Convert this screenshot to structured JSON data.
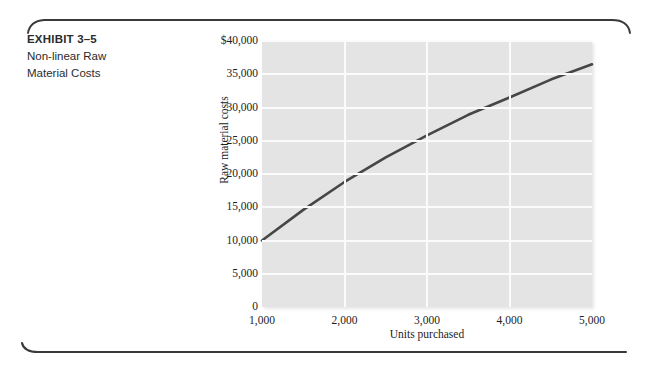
{
  "exhibit": {
    "title": "EXHIBIT 3–5",
    "subtitle_line1": "Non-linear Raw",
    "subtitle_line2": "Material Costs"
  },
  "colors": {
    "plot_background": "#e4e4e4",
    "gridline": "#fbfbfb",
    "curve": "#464646",
    "text": "#1d1d1d",
    "rule": "#3a3a3a",
    "page_background": "#ffffff"
  },
  "chart_data": {
    "type": "line",
    "title": "Non-linear Raw Material Costs",
    "xlabel": "Units purchased",
    "ylabel": "Raw material costs",
    "xlim": [
      1000,
      5000
    ],
    "ylim": [
      0,
      40000
    ],
    "grid": true,
    "legend": "none",
    "x_ticks": [
      1000,
      2000,
      3000,
      4000,
      5000
    ],
    "x_tick_labels": [
      "1,000",
      "2,000",
      "3,000",
      "4,000",
      "5,000"
    ],
    "y_ticks": [
      0,
      5000,
      10000,
      15000,
      20000,
      25000,
      30000,
      35000,
      40000
    ],
    "y_tick_labels": [
      "0",
      "5,000",
      "10,000",
      "15,000",
      "20,000",
      "25,000",
      "30,000",
      "35,000",
      "$40,000"
    ],
    "series": [
      {
        "name": "Raw material costs",
        "x": [
          1000,
          1500,
          2000,
          2500,
          3000,
          3500,
          4000,
          4500,
          5000
        ],
        "values": [
          10000,
          14600,
          18800,
          22500,
          25800,
          28900,
          31500,
          34200,
          36500
        ]
      }
    ]
  }
}
